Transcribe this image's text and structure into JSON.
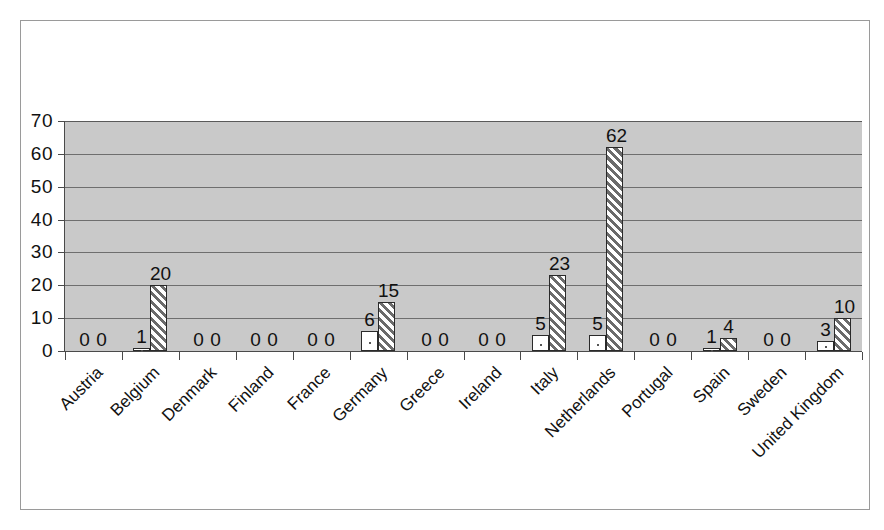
{
  "chart_data": {
    "type": "bar",
    "title": "",
    "subtitle": "",
    "xlabel": "",
    "ylabel": "",
    "ylim": [
      0,
      70
    ],
    "yticks": [
      0,
      10,
      20,
      30,
      40,
      50,
      60,
      70
    ],
    "grid": true,
    "legend": "none",
    "plot_background": "#c9c9c9",
    "gridline_color": "#6e6e6e",
    "categories": [
      "Austria",
      "Belgium",
      "Denmark",
      "Finland",
      "France",
      "Germany",
      "Greece",
      "Ireland",
      "Italy",
      "Netherlands",
      "Portugal",
      "Spain",
      "Sweden",
      "United Kingdom"
    ],
    "series": [
      {
        "name": "series-1",
        "pattern": "solid-white-dot",
        "fill": "#ffffff",
        "values": [
          0,
          1,
          0,
          0,
          0,
          6,
          0,
          0,
          5,
          5,
          0,
          1,
          0,
          3
        ]
      },
      {
        "name": "series-2",
        "pattern": "diagonal-hatch",
        "fill": "#6b6b6b",
        "values": [
          0,
          20,
          0,
          0,
          0,
          15,
          0,
          0,
          23,
          62,
          0,
          4,
          0,
          10
        ]
      }
    ],
    "data_labels": [
      {
        "category": "Austria",
        "series1": "0",
        "series2": "0"
      },
      {
        "category": "Belgium",
        "series1": "1",
        "series2": "20"
      },
      {
        "category": "Denmark",
        "series1": "0",
        "series2": "0"
      },
      {
        "category": "Finland",
        "series1": "0",
        "series2": "0"
      },
      {
        "category": "France",
        "series1": "0",
        "series2": "0"
      },
      {
        "category": "Germany",
        "series1": "6",
        "series2": "15"
      },
      {
        "category": "Greece",
        "series1": "0",
        "series2": "0"
      },
      {
        "category": "Ireland",
        "series1": "0",
        "series2": "0"
      },
      {
        "category": "Italy",
        "series1": "5",
        "series2": "23"
      },
      {
        "category": "Netherlands",
        "series1": "5",
        "series2": "62"
      },
      {
        "category": "Portugal",
        "series1": "0",
        "series2": "0"
      },
      {
        "category": "Spain",
        "series1": "1",
        "series2": "4"
      },
      {
        "category": "Sweden",
        "series1": "0",
        "series2": "0"
      },
      {
        "category": "United Kingdom",
        "series1": "3",
        "series2": "10"
      }
    ]
  }
}
